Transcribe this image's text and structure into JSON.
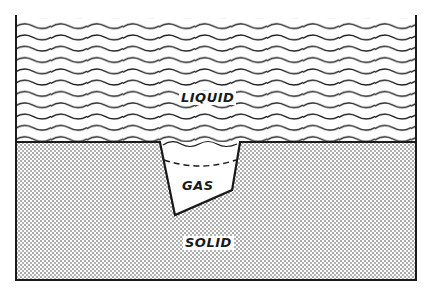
{
  "diagram": {
    "labels": {
      "liquid": "LIQUID",
      "gas": "GAS",
      "solid": "SOLID"
    },
    "regions": [
      "liquid",
      "solid",
      "gas-pocket"
    ],
    "colors": {
      "ink": "#1a1a1a",
      "background": "#ffffff",
      "stipple": "#2a2a2a"
    }
  }
}
